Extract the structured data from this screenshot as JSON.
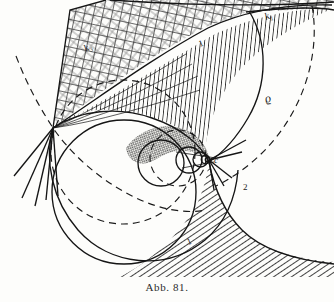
{
  "figure": {
    "caption": "Abb. 81.",
    "labels": [
      {
        "id": "k3",
        "text": "k",
        "sub": "3",
        "x": 86,
        "y": 52,
        "rotate": -28,
        "size": 10
      },
      {
        "id": "k1",
        "text": "k",
        "sub": "1",
        "x": 266,
        "y": 20,
        "rotate": -20,
        "size": 10
      },
      {
        "id": "rho",
        "text": "ϱ",
        "sub": "",
        "x": 266,
        "y": 103,
        "rotate": -18,
        "size": 12
      },
      {
        "id": "c",
        "text": "c",
        "sub": "",
        "x": 214,
        "y": 163,
        "rotate": 0,
        "size": 9
      },
      {
        "id": "n1",
        "text": "1",
        "sub": "",
        "x": 200,
        "y": 47,
        "rotate": -22,
        "size": 9
      },
      {
        "id": "n2",
        "text": "2",
        "sub": "",
        "x": 243,
        "y": 190,
        "rotate": 0,
        "size": 9
      },
      {
        "id": "n1b",
        "text": "1",
        "sub": "",
        "x": 188,
        "y": 245,
        "rotate": -20,
        "size": 9
      }
    ],
    "colors": {
      "ink": "#1a1a1a",
      "hatch": "#303030",
      "paper": "#fdfdfb",
      "stipple": "#3a3a3a"
    },
    "regions": [
      {
        "id": "upper-crosshatch",
        "pattern": "cross-hatch"
      },
      {
        "id": "mid-vertical",
        "pattern": "vertical-hatch"
      },
      {
        "id": "lower-right",
        "pattern": "diagonal-hatch"
      },
      {
        "id": "core-lens",
        "pattern": "dark-stipple"
      }
    ],
    "points": [
      {
        "id": "node",
        "x": 53,
        "y": 128
      },
      {
        "id": "c",
        "x": 208,
        "y": 160
      }
    ]
  }
}
